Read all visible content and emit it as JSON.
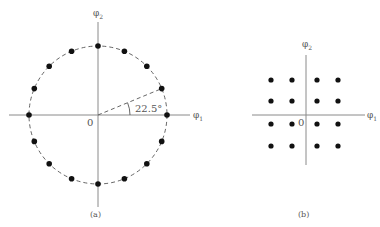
{
  "figure_a": {
    "caption": "(a)",
    "x_axis_label": "φ",
    "x_axis_sub": "1",
    "y_axis_label": "φ",
    "y_axis_sub": "2",
    "origin_label": "0",
    "angle_label": "22.5°",
    "num_points": 16,
    "angle_step_deg": 22.5,
    "description": "16-point circular constellation (16-PSK) on dashed circle"
  },
  "figure_b": {
    "caption": "(b)",
    "x_axis_label": "φ",
    "x_axis_sub": "1",
    "y_axis_label": "φ",
    "y_axis_sub": "2",
    "origin_label": "0",
    "grid": "4x4",
    "description": "16-point square constellation (16-QAM)"
  },
  "colors": {
    "axis": "#8a8a8a",
    "point": "#111111",
    "dashed_circle": "#555555",
    "text": "#555555"
  }
}
